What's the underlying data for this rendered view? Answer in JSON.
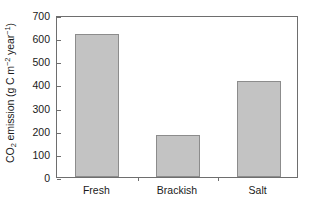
{
  "chart_data": {
    "type": "bar",
    "title": "",
    "xlabel": "",
    "ylabel": "CO2 emission (g C m-2 year-1)",
    "ylabel_parts": {
      "prefix": "CO",
      "sub1": "2",
      "mid": " emission (g C m",
      "sup1": "−2",
      "mid2": " year",
      "sup2": "−1",
      "suffix": ")"
    },
    "categories": [
      "Fresh",
      "Brackish",
      "Salt"
    ],
    "values": [
      620,
      180,
      415
    ],
    "ylim": [
      0,
      700
    ],
    "ytick_values": [
      0,
      100,
      200,
      300,
      400,
      500,
      600,
      700
    ],
    "ytick_labels": [
      "0",
      "100",
      "200",
      "300",
      "400",
      "500",
      "600",
      "700"
    ],
    "grid": false,
    "legend": null,
    "bar_color": "#c3c3c3",
    "bar_edge_color": "#8c8c8c",
    "axis_color": "#6e6e6e"
  }
}
